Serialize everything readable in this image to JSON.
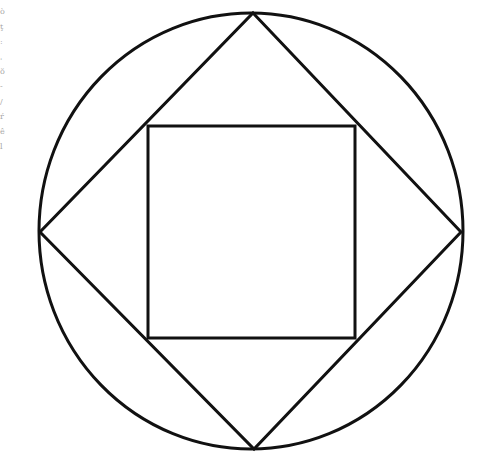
{
  "diagram": {
    "stroke_color": "#111111",
    "background": "#ffffff",
    "circle": {
      "cx": 251,
      "cy": 231,
      "rx": 212,
      "ry": 218
    },
    "diamond": {
      "top": [
        253,
        13
      ],
      "right": [
        461,
        232
      ],
      "bottom": [
        254,
        449
      ],
      "left": [
        40,
        232
      ]
    },
    "inner_square": {
      "x": 148,
      "y": 126,
      "width": 207,
      "height": 212
    }
  },
  "edge_text_fragments": [
    "ò",
    "ţ",
    ":",
    "ˌ",
    "ŏ",
    "-",
    "/",
    "ŕ",
    "ê",
    "l"
  ]
}
